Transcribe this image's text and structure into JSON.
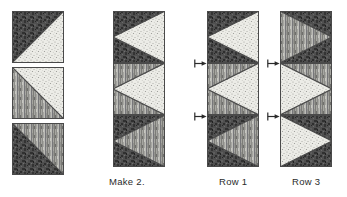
{
  "diagram": {
    "kind": "quilt-piecing-diagram",
    "background_color": "#ffffff",
    "fabrics": [
      {
        "id": "dark",
        "name": "dark-mottled-fabric",
        "color": "#4a4a4a",
        "description": "dark mottled print"
      },
      {
        "id": "medium",
        "name": "medium-striped-fabric",
        "color": "#9a9a96",
        "description": "medium grey vertical stripe"
      },
      {
        "id": "light",
        "name": "light-dotted-fabric",
        "color": "#e9e9e4",
        "description": "light speckled dot print"
      }
    ],
    "columns": [
      {
        "id": "units",
        "label": "",
        "x": 12,
        "y": 11,
        "square_size": 52,
        "gap": 4,
        "squares": [
          {
            "name": "half-square-triangle-unit-1",
            "top_left": "dark",
            "bottom_right": "light",
            "orientation": "tl-br"
          },
          {
            "name": "half-square-triangle-unit-2",
            "top_right": "light",
            "bottom_left": "medium",
            "orientation": "tr-bl"
          },
          {
            "name": "half-square-triangle-unit-3",
            "top_right": "medium",
            "bottom_left": "dark",
            "orientation": "tr-bl"
          }
        ]
      },
      {
        "id": "make2",
        "label": "Make 2.",
        "label_x": 109,
        "label_y": 176,
        "x": 113,
        "y": 11,
        "square_size": 52,
        "gap": 0,
        "point_direction": "left",
        "squares": [
          {
            "name": "make2-square-1",
            "left": "dark",
            "right": "light"
          },
          {
            "name": "make2-square-2",
            "left": "medium",
            "right": "light"
          },
          {
            "name": "make2-square-3",
            "left": "dark",
            "right": "medium"
          }
        ]
      },
      {
        "id": "row1",
        "label": "Row 1",
        "label_x": 219,
        "label_y": 176,
        "x": 207,
        "y": 11,
        "square_size": 52,
        "gap": 0,
        "point_direction": "left",
        "arrows": [
          {
            "name": "seam-arrow-row1-top",
            "x": 194,
            "y": 59,
            "direction": "right"
          },
          {
            "name": "seam-arrow-row1-bottom",
            "x": 194,
            "y": 112,
            "direction": "right"
          }
        ],
        "squares": [
          {
            "name": "row1-square-1",
            "left": "dark",
            "right": "light"
          },
          {
            "name": "row1-square-2",
            "left": "medium",
            "right": "light"
          },
          {
            "name": "row1-square-3",
            "left": "dark",
            "right": "medium"
          }
        ]
      },
      {
        "id": "row3",
        "label": "Row 3",
        "label_x": 292,
        "label_y": 176,
        "x": 280,
        "y": 11,
        "square_size": 52,
        "gap": 0,
        "point_direction": "right",
        "arrows": [
          {
            "name": "seam-arrow-row3-top",
            "x": 267,
            "y": 59,
            "direction": "right"
          },
          {
            "name": "seam-arrow-row3-bottom",
            "x": 267,
            "y": 112,
            "direction": "right"
          }
        ],
        "squares": [
          {
            "name": "row3-square-1",
            "left": "medium",
            "right": "dark"
          },
          {
            "name": "row3-square-2",
            "left": "light",
            "right": "medium"
          },
          {
            "name": "row3-square-3",
            "left": "light",
            "right": "dark"
          }
        ]
      }
    ]
  }
}
